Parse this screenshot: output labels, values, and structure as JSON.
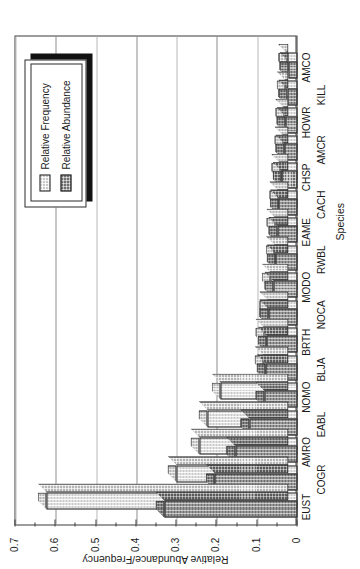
{
  "chart_data": {
    "type": "bar",
    "title": "",
    "xlabel": "Species",
    "ylabel": "Relative Abundance/Frequency",
    "orientation": "vertical-3d-grouped",
    "ylim": [
      0,
      0.7
    ],
    "ytick_labels": [
      "0",
      "0.1",
      "0.2",
      "0.3",
      "0.4",
      "0.5",
      "0.6",
      "0.7"
    ],
    "ytick_values": [
      0,
      0.1,
      0.2,
      0.3,
      0.4,
      0.5,
      0.6,
      0.7
    ],
    "grid": "value-axis gridlines only",
    "legend_position": "upper-right",
    "categories": [
      "EUST",
      "COGR",
      "AMRO",
      "EABL",
      "NOMO",
      "BLJA",
      "BRTH",
      "NOCA",
      "MODO",
      "RWBL",
      "EAME",
      "CACH",
      "CHSP",
      "AMCR",
      "HOWR",
      "KILL",
      "AMCO"
    ],
    "series": [
      {
        "name": "Relative Abundance",
        "values": [
          0.33,
          0.205,
          0.155,
          0.12,
          0.082,
          0.079,
          0.076,
          0.073,
          0.06,
          0.054,
          0.05,
          0.046,
          0.039,
          0.033,
          0.03,
          0.026,
          0.023
        ]
      },
      {
        "name": "Relative Frequency",
        "values": [
          0.622,
          0.3,
          0.243,
          0.223,
          0.19,
          0.084,
          0.082,
          0.073,
          0.066,
          0.056,
          0.055,
          0.048,
          0.043,
          0.035,
          0.033,
          0.029,
          0.026
        ]
      }
    ]
  },
  "legend": {
    "entries": [
      {
        "label": "Relative Frequency",
        "swatch": "light-checker"
      },
      {
        "label": "Relative Abundance",
        "swatch": "dark-checker"
      }
    ]
  },
  "colors": {
    "relative_frequency": "#c9c9c9",
    "relative_abundance": "#6e6e6e",
    "axis": "#3a3a3a",
    "gridline": "#8d8d8d",
    "background": "#ffffff",
    "text": "#1a1a1a"
  }
}
